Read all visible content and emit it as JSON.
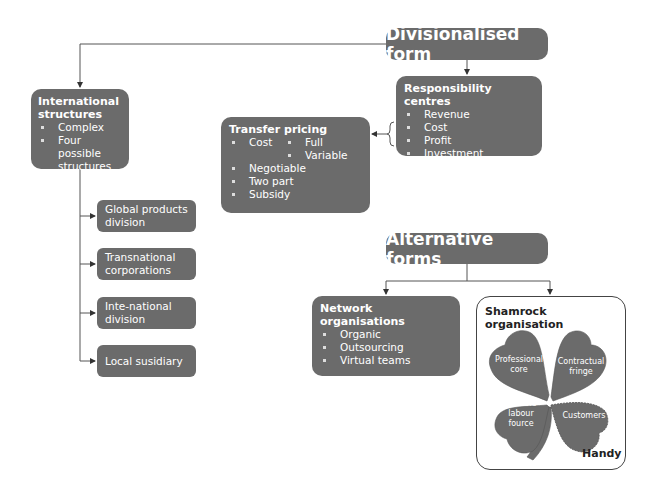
{
  "divisionalised": {
    "title": "Divisionalised form",
    "responsibility_centres": {
      "heading": "Responsibility centres",
      "items": [
        "Revenue",
        "Cost",
        "Profit",
        "Investment"
      ]
    },
    "transfer_pricing": {
      "heading": "Transfer pricing",
      "items": [
        "Cost",
        "Negotiable",
        "Two part",
        "Subsidy"
      ],
      "cost_subitems": [
        "Full",
        "Variable"
      ]
    },
    "international": {
      "heading": "International structures",
      "items": [
        "Complex",
        "Four possible structures"
      ],
      "structures": [
        "Global products division",
        "Transnational corporations",
        "Inte-national division",
        "Local susidiary"
      ]
    }
  },
  "alternative": {
    "title": "Alternative forms",
    "network": {
      "heading": "Network organisations",
      "items": [
        "Organic",
        "Outsourcing",
        "Virtual teams"
      ]
    },
    "shamrock": {
      "heading": "Shamrock organisation",
      "leaves": [
        "Professional core",
        "Contractual fringe",
        "Flexible labour fource",
        "Customers"
      ],
      "author": "Handy"
    }
  },
  "colors": {
    "box_fill": "#6b6b6b",
    "text": "#ffffff",
    "lines": "#444444"
  }
}
